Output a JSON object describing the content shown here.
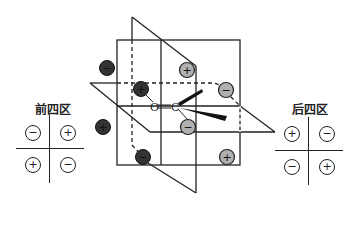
{
  "front_quadrants": {
    "title": "前四区",
    "signs": [
      "−",
      "+",
      "+",
      "−"
    ]
  },
  "back_quadrants": {
    "title": "后四区",
    "signs": [
      "+",
      "−",
      "−",
      "+"
    ]
  },
  "molecule": {
    "atom_o": "O",
    "atom_c": "C"
  },
  "colors": {
    "dark_ball": "#333333",
    "light_ball": "#b0b0b0",
    "line": "#222222"
  },
  "balls": [
    {
      "pos": "front-upper-left-outer",
      "sign": "−",
      "shade": "dark"
    },
    {
      "pos": "front-upper-left-inner",
      "sign": "+",
      "shade": "dark"
    },
    {
      "pos": "front-lower-left-outer",
      "sign": "+",
      "shade": "dark"
    },
    {
      "pos": "front-lower-left-inner",
      "sign": "−",
      "shade": "dark"
    },
    {
      "pos": "back-upper-right-top",
      "sign": "+",
      "shade": "light"
    },
    {
      "pos": "back-upper-right-mid",
      "sign": "−",
      "shade": "light"
    },
    {
      "pos": "back-lower-center",
      "sign": "−",
      "shade": "light"
    },
    {
      "pos": "back-lower-right",
      "sign": "+",
      "shade": "light"
    }
  ]
}
